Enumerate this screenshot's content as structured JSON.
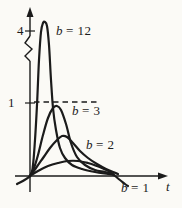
{
  "figure": {
    "background": "#fbfaf6",
    "ink": "#1b1b1b"
  },
  "chart_data": {
    "type": "line",
    "title": "",
    "xlabel": "t",
    "ylabel": "",
    "grid": false,
    "legend": "none (curves labeled inline)",
    "ylim": [
      -0.25,
      4.3
    ],
    "y_axis": {
      "arrow": true,
      "break_between": [
        1,
        4
      ],
      "ticks": [
        {
          "value": 4,
          "label": "4"
        },
        {
          "value": 1,
          "label": "1"
        }
      ]
    },
    "x_axis": {
      "arrow": true,
      "label": "t",
      "ticks": []
    },
    "guide_line": {
      "y": 1,
      "style": "dashed"
    },
    "series": [
      {
        "name": "b = 12",
        "b": 12,
        "label_var": "b",
        "label_eq": "= 12",
        "peak_value_est": 4.1,
        "shape": "very tall narrow peak",
        "points_px": [
          [
            17,
            184
          ],
          [
            30,
            176
          ],
          [
            33,
            165
          ],
          [
            35,
            140
          ],
          [
            37,
            105
          ],
          [
            39,
            60
          ],
          [
            41,
            32
          ],
          [
            43,
            23
          ],
          [
            45,
            22
          ],
          [
            47,
            26
          ],
          [
            49,
            45
          ],
          [
            51,
            80
          ],
          [
            53,
            108
          ],
          [
            56,
            130
          ],
          [
            60,
            148
          ],
          [
            65,
            158
          ],
          [
            72,
            165
          ],
          [
            82,
            169
          ],
          [
            95,
            172
          ],
          [
            108,
            174
          ],
          [
            114,
            175
          ]
        ]
      },
      {
        "name": "b = 3",
        "b": 3,
        "label_var": "b",
        "label_eq": "= 3",
        "peak_value_est": 0.95,
        "shape": "peak just below dashed line y=1",
        "points_px": [
          [
            30,
            176
          ],
          [
            34,
            168
          ],
          [
            38,
            155
          ],
          [
            43,
            135
          ],
          [
            48,
            118
          ],
          [
            53,
            108
          ],
          [
            57,
            106
          ],
          [
            61,
            110
          ],
          [
            66,
            124
          ],
          [
            71,
            143
          ],
          [
            77,
            157
          ],
          [
            85,
            165
          ],
          [
            95,
            170
          ],
          [
            105,
            172
          ],
          [
            113,
            174
          ]
        ]
      },
      {
        "name": "b = 2",
        "b": 2,
        "label_var": "b",
        "label_eq": "= 2",
        "peak_value_est": 0.55,
        "shape": "medium broad peak",
        "points_px": [
          [
            30,
            176
          ],
          [
            36,
            168
          ],
          [
            43,
            158
          ],
          [
            50,
            148
          ],
          [
            57,
            140
          ],
          [
            62,
            136
          ],
          [
            67,
            137
          ],
          [
            73,
            143
          ],
          [
            80,
            151
          ],
          [
            88,
            158
          ],
          [
            97,
            164
          ],
          [
            106,
            169
          ],
          [
            113,
            172
          ],
          [
            118,
            174
          ]
        ]
      },
      {
        "name": "b = 1",
        "b": 1,
        "label_var": "b",
        "label_eq": "= 1",
        "peak_value_est": 0.2,
        "shape": "low broad hump, tail dips below axis",
        "points_px": [
          [
            30,
            176
          ],
          [
            38,
            171
          ],
          [
            48,
            166
          ],
          [
            58,
            163
          ],
          [
            68,
            161
          ],
          [
            78,
            161
          ],
          [
            88,
            163
          ],
          [
            97,
            166
          ],
          [
            104,
            169
          ],
          [
            110,
            172
          ],
          [
            115,
            176
          ],
          [
            120,
            180
          ],
          [
            125,
            184
          ],
          [
            128,
            186
          ]
        ]
      }
    ]
  }
}
